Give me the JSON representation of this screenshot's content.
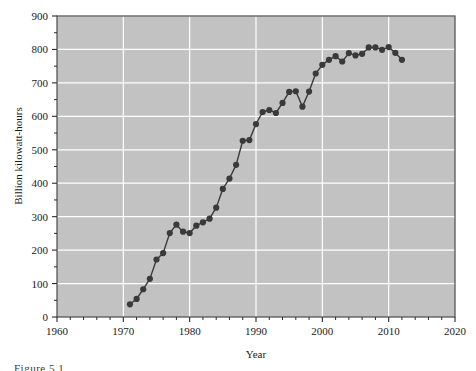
{
  "figure": {
    "caption_fragment": "Figure 5.1"
  },
  "chart_data": {
    "type": "line",
    "title": "",
    "xlabel": "Year",
    "ylabel": "Billion kilowatt-hours",
    "xlim": [
      1960,
      2020
    ],
    "ylim": [
      0,
      900
    ],
    "xticks": [
      1960,
      1970,
      1980,
      1990,
      2000,
      2010,
      2020
    ],
    "xtick_labels": [
      "1960",
      "1970",
      "1980",
      "1990",
      "2000",
      "2010",
      "2020"
    ],
    "x_minor_tick_step": 2,
    "yticks": [
      0,
      100,
      200,
      300,
      400,
      500,
      600,
      700,
      800,
      900
    ],
    "ytick_labels": [
      "0",
      "100",
      "200",
      "300",
      "400",
      "500",
      "600",
      "700",
      "800",
      "900"
    ],
    "y_minor_tick_step": 50,
    "grid": true,
    "grid_color": "#ffffff",
    "plot_background": "#c2c2c2",
    "line_color": "#3a3a3a",
    "marker": "circle",
    "marker_color": "#3a3a3a",
    "legend": "none",
    "x": [
      1971,
      1972,
      1973,
      1974,
      1975,
      1976,
      1977,
      1978,
      1979,
      1980,
      1981,
      1982,
      1983,
      1984,
      1985,
      1986,
      1987,
      1988,
      1989,
      1990,
      1991,
      1992,
      1993,
      1994,
      1995,
      1996,
      1997,
      1998,
      1999,
      2000,
      2001,
      2002,
      2003,
      2004,
      2005,
      2006,
      2007,
      2008,
      2009,
      2010,
      2011,
      2012
    ],
    "values": [
      38,
      54,
      83,
      114,
      172,
      191,
      251,
      276,
      255,
      251,
      273,
      283,
      294,
      327,
      383,
      414,
      455,
      527,
      529,
      577,
      613,
      619,
      610,
      640,
      673,
      675,
      629,
      674,
      728,
      754,
      769,
      780,
      764,
      789,
      782,
      787,
      806,
      806,
      799,
      807,
      790,
      769
    ],
    "annotations": []
  }
}
